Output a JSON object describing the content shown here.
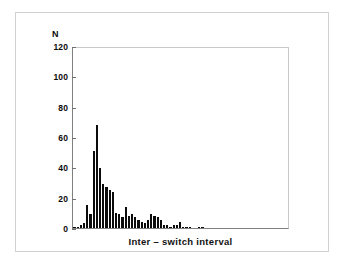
{
  "figure": {
    "background_color": "#ffffff",
    "frame_color": "#d2d2d2",
    "axis_color": "#808080",
    "bar_color": "#0b0b0b"
  },
  "chart_data": {
    "type": "bar",
    "title": "",
    "subtitle": "",
    "xlabel": "Inter – switch interval",
    "ylabel": "N",
    "ylim": [
      0,
      120
    ],
    "yticks": [
      0,
      20,
      40,
      60,
      80,
      100,
      120
    ],
    "ytick_labels": [
      "0",
      "20",
      "40",
      "60",
      "80",
      "100",
      "120"
    ],
    "xticks": [],
    "xtick_labels": [],
    "grid": false,
    "legend": null,
    "bin_count": 44,
    "categories": [
      "1",
      "2",
      "3",
      "4",
      "5",
      "6",
      "7",
      "8",
      "9",
      "10",
      "11",
      "12",
      "13",
      "14",
      "15",
      "16",
      "17",
      "18",
      "19",
      "20",
      "21",
      "22",
      "23",
      "24",
      "25",
      "26",
      "27",
      "28",
      "29",
      "30",
      "31",
      "32",
      "33",
      "34",
      "35",
      "36",
      "37",
      "38",
      "39",
      "40",
      "41",
      "42",
      "43",
      "44"
    ],
    "values": [
      1,
      1,
      2,
      3,
      15,
      9,
      51,
      68,
      40,
      29,
      27,
      25,
      24,
      10,
      9,
      7,
      14,
      8,
      9,
      7,
      5,
      4,
      3,
      5,
      9,
      8,
      7,
      5,
      2,
      2,
      1,
      2,
      2,
      4,
      1,
      1,
      1,
      0,
      0,
      1,
      1,
      0,
      0,
      0
    ],
    "peak_value": 68,
    "annotations": []
  },
  "axis": {
    "y_title": "N",
    "x_title": "Inter – switch interval"
  }
}
